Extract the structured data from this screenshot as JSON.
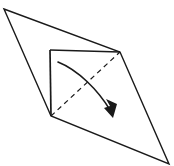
{
  "figure": {
    "colors": {
      "stroke": "#1a1a1a",
      "background": "#ffffff",
      "dash_stroke": "#1a1a1a",
      "arrow": "#1a1a1a"
    },
    "canvas": {
      "width": 174,
      "height": 166
    },
    "outer_sheet": {
      "label": "outer sheet",
      "points": "4,9 120,52 169,164 51,116",
      "stroke_width": 1.4
    },
    "inner_panel": {
      "label": "inner square panel",
      "points": "50,50 120,52 120,52 51,116",
      "left_edge": "50,50 51,116",
      "top_edge": "50,50 120,52",
      "bottom_edge": "51,116 120,52",
      "stroke_width": 1.7
    },
    "crease_line": {
      "label": "dashed diagonal crease",
      "from": "51,116",
      "to": "120,52",
      "dash_pattern": "5,4",
      "stroke_width": 1.2
    },
    "fold_arrow": {
      "label": "fold direction arrow",
      "path": "M 58,62 C 78,70 98,90 110,110",
      "stroke_width": 1.6,
      "head_points": "113,118 104,108 110,106 106,99 117,104"
    }
  }
}
